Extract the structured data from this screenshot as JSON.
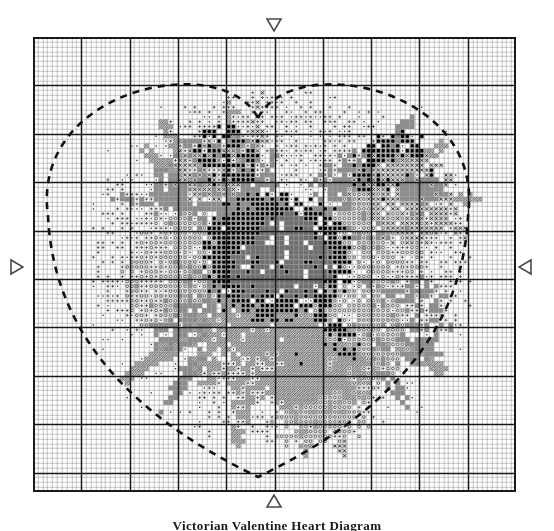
{
  "chart_data": {
    "type": "table",
    "xlabel": "",
    "ylabel": "",
    "grid": true,
    "grid_columns": 100,
    "grid_rows": 94,
    "cell_size_px": 4.83,
    "bold_line_every": 10,
    "legend_position": "none",
    "symbols": [
      {
        "key": "dot",
        "glyph": "·",
        "cell_fill": "#ffffff",
        "ink": "#2b2b2b",
        "label": "light tint - small dot"
      },
      {
        "key": "plus",
        "glyph": "+",
        "cell_fill": "#ffffff",
        "ink": "#2b2b2b",
        "label": "pale tint - plus"
      },
      {
        "key": "circle",
        "glyph": "o",
        "cell_fill": "#f2f2f2",
        "ink": "#3a3a3a",
        "label": "mid tint - open circle"
      },
      {
        "key": "ex",
        "glyph": "x",
        "cell_fill": "#d8d8d8",
        "ink": "#222222",
        "label": "medium shade - cross"
      },
      {
        "key": "star",
        "glyph": "*",
        "cell_fill": "#9a9a9a",
        "ink": "#000000",
        "label": "dark shade - asterisk"
      },
      {
        "key": "hatch",
        "glyph": "/",
        "cell_fill": "#c2c2c2",
        "ink": "#555555",
        "label": "diagonal hatch fill"
      },
      {
        "key": "solid",
        "glyph": " ",
        "cell_fill": "#8c8c8c",
        "ink": "#8c8c8c",
        "label": "solid mid grey block"
      },
      {
        "key": "soliddark",
        "glyph": " ",
        "cell_fill": "#6e6e6e",
        "ink": "#6e6e6e",
        "label": "solid dark grey block"
      },
      {
        "key": "white",
        "glyph": " ",
        "cell_fill": "#ffffff",
        "ink": "#ffffff",
        "label": "blank / background"
      }
    ],
    "colors": {
      "grid_fine": "#8a8a8a",
      "grid_bold": "#1a1a1a",
      "frame": "#1a1a1a",
      "heart_dash": "#111111",
      "marker_stroke": "#4a4a4a",
      "page_background": "#ffffff"
    },
    "heart_outline": {
      "style": "dashed",
      "dash_px": [
        7,
        6
      ],
      "stroke_width_px": 2.6,
      "top_notch_y_px": 118,
      "bottom_point_y_px": 477,
      "left_extent_x_px": 48,
      "right_extent_x_px": 468
    }
  },
  "chart": {
    "markers": {
      "top": {
        "name": "center-marker-top",
        "direction": "down"
      },
      "bottom": {
        "name": "center-marker-bottom",
        "direction": "up"
      },
      "left": {
        "name": "center-marker-left",
        "direction": "right"
      },
      "right": {
        "name": "center-marker-right",
        "direction": "left"
      }
    }
  },
  "caption": {
    "text": "Victorian Valentine Heart Diagram"
  }
}
